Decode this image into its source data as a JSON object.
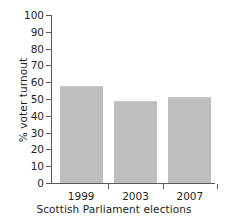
{
  "chart_data": {
    "type": "bar",
    "title": "",
    "subtitle": "",
    "xlabel": "Scottish Parliament elections",
    "ylabel": "% voter turnout",
    "categories": [
      "1999",
      "2003",
      "2007"
    ],
    "values": [
      58,
      49,
      51
    ],
    "series": [
      {
        "name": "% voter turnout",
        "values": [
          58,
          49,
          51
        ]
      }
    ],
    "ylim": [
      0,
      100
    ],
    "yticks": [
      0,
      10,
      20,
      30,
      40,
      50,
      60,
      70,
      80,
      90,
      100
    ],
    "ytick_labels": [
      "0",
      "10",
      "20",
      "30",
      "40",
      "50",
      "60",
      "70",
      "80",
      "90",
      "100"
    ],
    "grid": false,
    "legend": false,
    "legend_position": "none",
    "bar_color": "#bebebe",
    "axis_color": "#58595b",
    "text_color": "#231f20",
    "background": "#ffffff"
  },
  "axes": {
    "y_title": "% voter turnout",
    "x_title": "Scottish Parliament elections"
  },
  "ticks": {
    "y": [
      {
        "label": "100",
        "value": 100
      },
      {
        "label": "90",
        "value": 90
      },
      {
        "label": "80",
        "value": 80
      },
      {
        "label": "70",
        "value": 70
      },
      {
        "label": "60",
        "value": 60
      },
      {
        "label": "50",
        "value": 50
      },
      {
        "label": "40",
        "value": 40
      },
      {
        "label": "30",
        "value": 30
      },
      {
        "label": "20",
        "value": 20
      },
      {
        "label": "10",
        "value": 10
      },
      {
        "label": "0",
        "value": 0
      }
    ]
  },
  "bars": [
    {
      "category": "1999",
      "value": 58
    },
    {
      "category": "2003",
      "value": 49
    },
    {
      "category": "2007",
      "value": 51
    }
  ]
}
